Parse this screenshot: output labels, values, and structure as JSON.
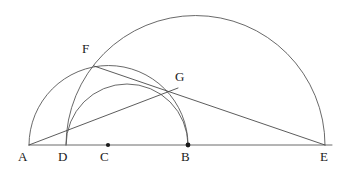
{
  "diagram": {
    "kind": "euclidean-construction",
    "canvas": {
      "width": 350,
      "height": 174,
      "background": "#ffffff"
    },
    "stroke_colors": {
      "arc": "#585858",
      "segment": "#4a4a4a",
      "baseline": "#6a6a6a",
      "dot": "#1a1a1a",
      "label": "#1a1a1a"
    },
    "baseline": {
      "y": 145,
      "x_start": 29,
      "x_end": 332
    },
    "points": [
      {
        "id": "A",
        "label": "A",
        "x": 29,
        "y": 145,
        "dot": false,
        "label_x": 18,
        "label_y": 150
      },
      {
        "id": "D",
        "label": "D",
        "x": 66,
        "y": 145,
        "dot": false,
        "label_x": 58,
        "label_y": 150
      },
      {
        "id": "C",
        "label": "C",
        "x": 108,
        "y": 145,
        "dot": true,
        "label_x": 100,
        "label_y": 150
      },
      {
        "id": "B",
        "label": "B",
        "x": 188,
        "y": 145,
        "dot": true,
        "label_x": 181,
        "label_y": 150
      },
      {
        "id": "E",
        "label": "E",
        "x": 325,
        "y": 145,
        "dot": false,
        "label_x": 320,
        "label_y": 150
      },
      {
        "id": "F",
        "label": "F",
        "x": 94,
        "y": 66,
        "dot": false,
        "label_x": 82,
        "label_y": 42
      },
      {
        "id": "G",
        "label": "G",
        "x": 170,
        "y": 90,
        "dot": false,
        "label_x": 175,
        "label_y": 70
      }
    ],
    "arcs": [
      {
        "id": "arc-DE",
        "name": "large-semicircle-D-E",
        "from": "D",
        "to": "E",
        "center_x": 195.5,
        "center_y": 145,
        "radius": 129.5
      },
      {
        "id": "arc-AB",
        "name": "semicircle-A-B",
        "from": "A",
        "to": "B",
        "center_x": 108.5,
        "center_y": 145,
        "radius": 79.5
      },
      {
        "id": "arc-DB",
        "name": "semicircle-D-B",
        "from": "D",
        "to": "B",
        "center_x": 127,
        "center_y": 145,
        "radius": 61
      }
    ],
    "segments": [
      {
        "id": "seg-AE",
        "name": "baseline-A-E",
        "from": "A",
        "to": "E"
      },
      {
        "id": "seg-AG",
        "name": "segment-A-G",
        "from": "A",
        "to": "G"
      },
      {
        "id": "seg-FE",
        "name": "segment-F-E",
        "from": "F",
        "to": "E"
      }
    ]
  }
}
